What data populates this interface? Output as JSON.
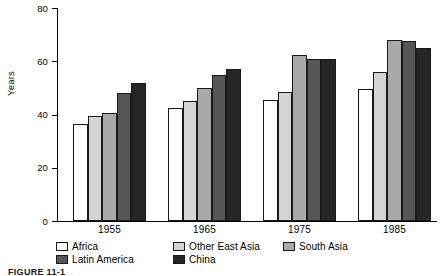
{
  "chart_data": {
    "type": "bar",
    "title": "",
    "xlabel": "",
    "ylabel": "Years",
    "categories": [
      "1955",
      "1965",
      "1975",
      "1985"
    ],
    "ylim": [
      0,
      80
    ],
    "yticks": [
      0,
      20,
      40,
      60,
      80
    ],
    "grid": false,
    "legend_position": "bottom-left",
    "series": [
      {
        "name": "Africa",
        "color": "#ffffff",
        "values": [
          36.5,
          42.5,
          45.5,
          49.5
        ]
      },
      {
        "name": "Other East Asia",
        "color": "#d4d4d4",
        "values": [
          39.5,
          45.0,
          48.5,
          56.0
        ]
      },
      {
        "name": "South Asia",
        "color": "#a9a9a9",
        "values": [
          40.5,
          50.0,
          62.5,
          68.0
        ]
      },
      {
        "name": "Latin America",
        "color": "#565656",
        "values": [
          48.0,
          55.0,
          61.0,
          67.5
        ]
      },
      {
        "name": "China",
        "color": "#262626",
        "values": [
          52.0,
          57.0,
          61.0,
          65.0
        ]
      }
    ]
  },
  "axis": {
    "y_title": "Years",
    "y_tick_labels": [
      "80",
      "60",
      "40",
      "20",
      "0"
    ]
  },
  "legend": {
    "items": [
      {
        "label": "Africa",
        "swatch": "#ffffff"
      },
      {
        "label": "Other East Asia",
        "swatch": "#d4d4d4"
      },
      {
        "label": "South Asia",
        "swatch": "#a9a9a9"
      },
      {
        "label": "Latin America",
        "swatch": "#565656"
      },
      {
        "label": "China",
        "swatch": "#262626"
      }
    ]
  },
  "caption": "FIGURE 11-1"
}
